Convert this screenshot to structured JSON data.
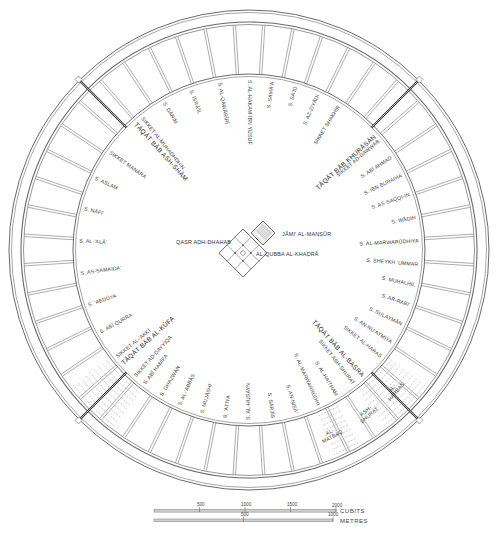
{
  "plan": {
    "center": {
      "x": 249,
      "y": 250
    },
    "radii": {
      "outer_wall": 240,
      "outer_wall_inner": 237,
      "intervallum": 228,
      "arcade_outer": 225,
      "arcade_inner": 176,
      "arcade_inner2": 173
    },
    "line_color": "#6a6a6a",
    "hatch_color": "#9a9a9a"
  },
  "central": {
    "palace": "QAṢR ADH-DHAHAB",
    "dome": "AL-QUBBA AL-KHAḌRĀ",
    "mosque": "JĀMI' AL-MANṢŪR"
  },
  "gates": [
    {
      "label": "ṬĀQĀT BĀB ASH-SHĀM",
      "angle": -135
    },
    {
      "label": "ṬĀQĀT BĀB KHURĀSĀN",
      "angle": -45
    },
    {
      "label": "ṬĀQĀT BĀB AL-BAṢRA",
      "angle": 45
    },
    {
      "label": "ṬĀQĀT BĀB AL-KŪFA",
      "angle": 135
    }
  ],
  "streets": [
    {
      "label": "S. AL-HAKAM IBN YŪSUF",
      "angle": -90
    },
    {
      "label": "S. SAMĀ'A",
      "angle": -82
    },
    {
      "label": "S. SA'ID",
      "angle": -74
    },
    {
      "label": "S. AZ-ZIYĀDI",
      "angle": -66
    },
    {
      "label": "SIKKET SHAKHIR",
      "angle": -58
    },
    {
      "label": "SIKKET AD-DAWWĀB",
      "angle": -40
    },
    {
      "label": "S. ABĪ AHMAD",
      "angle": -33
    },
    {
      "label": "S. IBN BURAIHA",
      "angle": -26
    },
    {
      "label": "S. AS-SAQQI-IN",
      "angle": -19
    },
    {
      "label": "S. WĀḌIḤ",
      "angle": -11
    },
    {
      "label": "S. AL-MARWARŪDHIYA",
      "angle": -3
    },
    {
      "label": "S. SHEYKH 'UMMAR",
      "angle": 5
    },
    {
      "label": "S. MUHALHIL",
      "angle": 12
    },
    {
      "label": "S. AR-RABI'",
      "angle": 19
    },
    {
      "label": "S. SULAYMĀN",
      "angle": 26
    },
    {
      "label": "S. AN-NU'AYMIYA",
      "angle": 33
    },
    {
      "label": "SIKKET AL-HARAS",
      "angle": 39
    },
    {
      "label": "SIKKET ASH-SHURAT",
      "angle": 52
    },
    {
      "label": "S. AL-HAITHAM",
      "angle": 59
    },
    {
      "label": "S. AL-MARWARRŪDHI",
      "angle": 66
    },
    {
      "label": "S. AN-NISĀ'",
      "angle": 74
    },
    {
      "label": "S. SARJĪS",
      "angle": 82
    },
    {
      "label": "S. AL-HUSAYN",
      "angle": 90
    },
    {
      "label": "S. 'AṬIYA",
      "angle": 98
    },
    {
      "label": "S. MUJĀSHI'",
      "angle": 106
    },
    {
      "label": "S. AL-'ABBĀS",
      "angle": 114
    },
    {
      "label": "S. GHAZWĀN",
      "angle": 121
    },
    {
      "label": "S. ABĪ HANĪFA",
      "angle": 128
    },
    {
      "label": "SIKKET AD-DAYYIQA",
      "angle": 132
    },
    {
      "label": "SIKKET AL-'AKKĪ",
      "angle": 141
    },
    {
      "label": "S. ABĪ QURRA",
      "angle": 151
    },
    {
      "label": "S. 'ABDŪYA",
      "angle": 161
    },
    {
      "label": "S. AS-SAMAIDA'",
      "angle": 172
    },
    {
      "label": "S. AL-'ALĀ'",
      "angle": 183
    },
    {
      "label": "S. NĀFI'",
      "angle": 194
    },
    {
      "label": "S. ASLAM",
      "angle": 205
    },
    {
      "label": "SIKKET MANĀRA",
      "angle": 215
    },
    {
      "label": "SIKKET AL-MUHADHDHIN",
      "angle": 231
    },
    {
      "label": "S. DĀRIM",
      "angle": 240
    },
    {
      "label": "S. ISRĀ'ĪL",
      "angle": 250
    },
    {
      "label": "S. AL-QAWĀRĪRĪ",
      "angle": 260
    }
  ],
  "special_blocks": [
    {
      "label_lines": [
        "AL-",
        "HARBAS"
      ],
      "angle": 40
    },
    {
      "label_lines": [
        "ASH-",
        "SHURAT"
      ],
      "angle": 50
    },
    {
      "label_lines": [
        "AL-",
        "MATBAQ"
      ],
      "angle": 62
    }
  ],
  "scale": {
    "cubits": {
      "ticks": [
        "500",
        "1000",
        "1500",
        "2000"
      ],
      "unit": "CUBITS"
    },
    "metres": {
      "ticks": [
        "500",
        "1000"
      ],
      "unit": "METRES"
    }
  }
}
